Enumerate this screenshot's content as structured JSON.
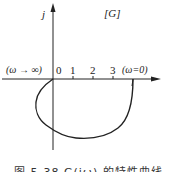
{
  "diagram": {
    "plane_label": "[G]",
    "imag_axis_label": "j",
    "real_tick_labels": [
      "0",
      "1",
      "2",
      "3"
    ],
    "omega_inf_label": "(ω → ∞)",
    "omega_zero_label": "(ω=0)",
    "curve": {
      "description": "Nyquist plot starting on positive real axis at ω=0, sweeping clockwise through lower half-plane, crossing negative imaginary axis, entering second/third quadrant and ending at origin as ω→∞",
      "start_real": 4,
      "end_real": 0
    },
    "caption": "图 5-38   G(jω) 的特性曲线"
  },
  "colors": {
    "ink": "#222222",
    "background": "#ffffff"
  }
}
